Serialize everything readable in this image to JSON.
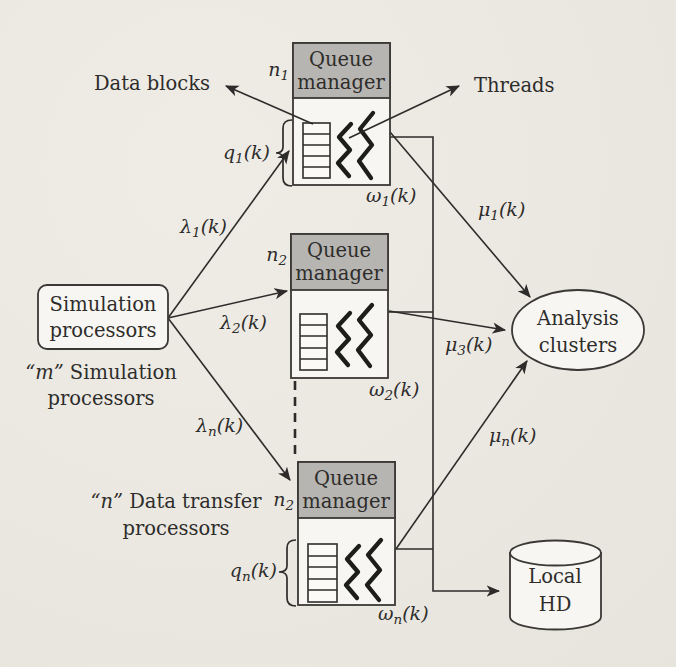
{
  "figure": {
    "bg_color": "#ece9e3",
    "header_fill": "#b7b5b1",
    "box_fill": "#f7f6f2",
    "line_color": "#2d2c2a",
    "text_color": "#2e2d2b"
  },
  "nodes": {
    "simulation_processors": {
      "line1": "Simulation",
      "line2": "processors"
    },
    "m_caption": {
      "emph": "“m”",
      "rest": " Simulation",
      "line2": "processors"
    },
    "n_caption": {
      "emph": "“n”",
      "rest": " Data transfer",
      "line2": "processors"
    },
    "analysis_clusters": {
      "line1": "Analysis",
      "line2": "clusters"
    },
    "local_hd": {
      "line1": "Local",
      "line2": "HD"
    },
    "queue_managers": [
      {
        "n_label": {
          "base": "n",
          "sub": "1"
        },
        "header1": "Queue",
        "header2": "manager",
        "omega": {
          "base": "ω",
          "sub": "1",
          "suffix": "(k)"
        },
        "q_label": {
          "base": "q",
          "sub": "1",
          "suffix": "(k)"
        }
      },
      {
        "n_label": {
          "base": "n",
          "sub": "2"
        },
        "header1": "Queue",
        "header2": "manager",
        "omega": {
          "base": "ω",
          "sub": "2",
          "suffix": "(k)"
        }
      },
      {
        "n_label": {
          "base": "n",
          "sub": "2"
        },
        "header1": "Queue",
        "header2": "manager",
        "omega": {
          "base": "ω",
          "sub": "n",
          "suffix": "(k)"
        },
        "q_label": {
          "base": "q",
          "sub": "n",
          "suffix": "(k)"
        }
      }
    ]
  },
  "edges": {
    "data_blocks": "Data blocks",
    "threads": "Threads",
    "lambda1": {
      "base": "λ",
      "sub": "1",
      "suffix": "(k)"
    },
    "lambda2": {
      "base": "λ",
      "sub": "2",
      "suffix": "(k)"
    },
    "lambdan": {
      "base": "λ",
      "sub": "n",
      "suffix": "(k)"
    },
    "mu1": {
      "base": "μ",
      "sub": "1",
      "suffix": "(k)"
    },
    "mu3": {
      "base": "μ",
      "sub": "3",
      "suffix": "(k)"
    },
    "mun": {
      "base": "μ",
      "sub": "n",
      "suffix": "(k)"
    }
  }
}
